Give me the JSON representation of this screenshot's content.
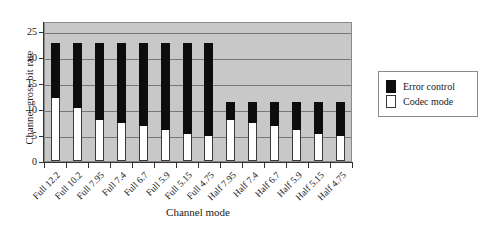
{
  "chart_data": {
    "type": "bar",
    "subtype": "stacked-bar",
    "title": "",
    "xlabel": "Channel mode",
    "ylabel": "Channel gross bit rate",
    "ylim": [
      0,
      27
    ],
    "yticks": [
      0,
      5,
      10,
      15,
      20,
      25
    ],
    "grid": true,
    "grid_axis": "y",
    "legend_position": "right",
    "categories": [
      "Full 12.2",
      "Full 10.2",
      "Full 7.95",
      "Full 7.4",
      "Full 6.7",
      "Full 5.9",
      "Full 5.15",
      "Full 4.75",
      "Half 7.95",
      "Half 7.4",
      "Half 6.7",
      "Half 5.9",
      "Half 5.15",
      "Half 4.75"
    ],
    "series": [
      {
        "name": "Codec mode",
        "color": "#ffffff",
        "values": [
          12.2,
          10.2,
          7.95,
          7.4,
          6.7,
          5.9,
          5.15,
          4.75,
          7.95,
          7.4,
          6.7,
          5.9,
          5.15,
          4.75
        ]
      },
      {
        "name": "Error control",
        "color": "#0d0d0d",
        "values": [
          10.6,
          12.6,
          14.85,
          15.4,
          16.1,
          16.9,
          17.65,
          18.05,
          3.45,
          4.0,
          4.7,
          5.5,
          6.25,
          6.65
        ]
      }
    ],
    "totals": [
      22.8,
      22.8,
      22.8,
      22.8,
      22.8,
      22.8,
      22.8,
      22.8,
      11.4,
      11.4,
      11.4,
      11.4,
      11.4,
      11.4
    ]
  },
  "legend": {
    "entries": [
      {
        "label": "Error control",
        "swatch": "black-square-swatch"
      },
      {
        "label": "Codec mode",
        "swatch": "white-square-swatch"
      }
    ]
  },
  "colors": {
    "plot_background": "#c8c8c8",
    "gridline": "#777777",
    "axis": "#333333",
    "error_control": "#0d0d0d",
    "codec_mode": "#ffffff"
  }
}
